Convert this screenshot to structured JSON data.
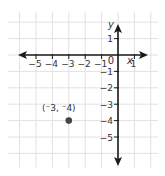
{
  "chart_data": {
    "type": "scatter",
    "title": "",
    "xlabel": "x",
    "ylabel": "y",
    "xlim": [
      -6,
      2
    ],
    "ylim": [
      -6,
      2
    ],
    "grid": true,
    "x_ticks": [
      "-5",
      "-4",
      "-3",
      "-2",
      "-1",
      "0",
      "1"
    ],
    "y_ticks": [
      "1",
      "-1",
      "-2",
      "-3",
      "-4",
      "-5"
    ],
    "origin_label": "0",
    "points": [
      {
        "x": -3,
        "y": -4,
        "label": "(⁻3, ⁻4)"
      }
    ]
  },
  "colors": {
    "grid": "#e2e2e2",
    "axis": "#1a1a1a",
    "point": "#444444",
    "text": "#333333"
  }
}
